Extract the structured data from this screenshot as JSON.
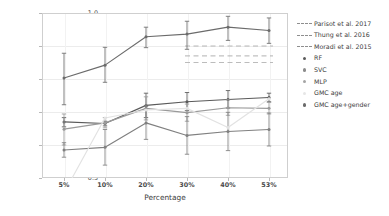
{
  "chart_data": {
    "type": "line",
    "title": "",
    "xlabel": "Percentage",
    "ylabel": "AUC",
    "categories": [
      "5%",
      "10%",
      "20%",
      "30%",
      "40%",
      "53%"
    ],
    "ylim": [
      0.5,
      1.0
    ],
    "yticks": [
      "1.0",
      "0.9",
      "0.8",
      "0.7",
      "0.6",
      "0.5"
    ],
    "ytick_values": [
      1.0,
      0.9,
      0.8,
      0.7,
      0.6,
      0.5
    ],
    "grid": true,
    "legend_position": "right",
    "series": [
      {
        "name": "GMC age+gender",
        "kind": "line",
        "color": "#6b6b6b",
        "values": [
          0.803,
          0.842,
          0.928,
          0.936,
          0.957,
          0.947
        ],
        "err_low": [
          0.722,
          0.79,
          0.895,
          0.89,
          0.917,
          0.908
        ],
        "err_high": [
          0.878,
          0.896,
          0.957,
          0.975,
          0.99,
          0.985
        ]
      },
      {
        "name": "RF",
        "kind": "line",
        "color": "#5a5a5a",
        "values": [
          0.67,
          0.665,
          0.72,
          0.731,
          0.738,
          0.744
        ],
        "err_low": [
          0.655,
          0.658,
          0.683,
          0.704,
          0.712,
          0.731
        ],
        "err_high": [
          0.683,
          0.672,
          0.757,
          0.759,
          0.765,
          0.757
        ]
      },
      {
        "name": "SVC",
        "kind": "line",
        "color": "#9a9a9a",
        "values": [
          0.648,
          0.667,
          0.711,
          0.698,
          0.713,
          0.711
        ],
        "err_low": [
          0.6,
          0.652,
          0.676,
          0.672,
          0.69,
          0.694
        ],
        "err_high": [
          0.694,
          0.683,
          0.746,
          0.724,
          0.737,
          0.729
        ]
      },
      {
        "name": "MLP",
        "kind": "line",
        "color": "#808080",
        "values": [
          0.585,
          0.593,
          0.667,
          0.629,
          0.641,
          0.647
        ],
        "err_low": [
          0.563,
          0.539,
          0.617,
          0.572,
          0.583,
          0.597
        ],
        "err_high": [
          0.607,
          0.647,
          0.717,
          0.686,
          0.699,
          0.697
        ]
      },
      {
        "name": "GMC age",
        "kind": "line",
        "color": "#e2e2e2",
        "values": [
          0.455,
          0.682,
          0.706,
          0.711,
          0.653,
          0.74
        ],
        "err_low": [
          0.455,
          0.682,
          0.706,
          0.711,
          0.653,
          0.74
        ],
        "err_high": [
          0.455,
          0.682,
          0.706,
          0.711,
          0.653,
          0.74
        ]
      }
    ],
    "reference_lines": [
      {
        "name": "Parisot et al. 2017",
        "value": 0.9,
        "color": "#b0b0b0",
        "style": "dashed",
        "x_from": "30%",
        "x_to": "53%"
      },
      {
        "name": "Thung et al. 2016",
        "value": 0.87,
        "color": "#a8a8a8",
        "style": "dashed",
        "x_from": "30%",
        "x_to": "53%"
      },
      {
        "name": "Moradi et al. 2015",
        "value": 0.85,
        "color": "#b4b4b4",
        "style": "dashed",
        "x_from": "30%",
        "x_to": "53%"
      }
    ]
  },
  "legend": {
    "items": [
      {
        "label": "Parisot et al. 2017",
        "marker": "dashed-line-key",
        "color": "#9c9c9c"
      },
      {
        "label": "Thung et al. 2016",
        "marker": "dashed-line-key",
        "color": "#9c9c9c"
      },
      {
        "label": "Moradi et al. 2015",
        "marker": "dashed-line-key",
        "color": "#9c9c9c"
      },
      {
        "label": "RF",
        "marker": "dot-key",
        "color": "#5a5a5a"
      },
      {
        "label": "SVC",
        "marker": "dot-key",
        "color": "#8c8c8c"
      },
      {
        "label": "MLP",
        "marker": "dot-key",
        "color": "#a5a5a5"
      },
      {
        "label": "GMC age",
        "marker": "dot-key",
        "color": "#e6e6e6"
      },
      {
        "label": "GMC age+gender",
        "marker": "dot-key",
        "color": "#6b6b6b"
      }
    ]
  }
}
